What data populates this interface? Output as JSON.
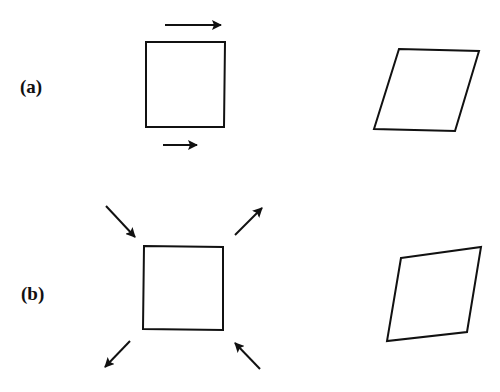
{
  "figure": {
    "panels": [
      {
        "id": "a",
        "label": "(a)",
        "description": "Pure shear: square with horizontal shear arrows deforms into a parallelogram",
        "before": {
          "shape": "square",
          "points": "146,42 225,42 224,127 146,127"
        },
        "after": {
          "shape": "parallelogram",
          "points": "399,49 479,51 455,131 374,129"
        },
        "arrows": [
          {
            "name": "top-shear-arrow",
            "from": [
              165,
              25
            ],
            "to": [
              221,
              25
            ],
            "direction": "right"
          },
          {
            "name": "bottom-shear-arrow",
            "from": [
              163,
              145
            ],
            "to": [
              197,
              145
            ],
            "direction": "right"
          }
        ]
      },
      {
        "id": "b",
        "label": "(b)",
        "description": "Diagonal tension/compression: square deforms into a rhombus",
        "before": {
          "shape": "square",
          "points": "144,246 223,247 223,330 143,329"
        },
        "after": {
          "shape": "rhombus",
          "points": "401,258 481,247 467,332 387,341"
        },
        "arrows": [
          {
            "name": "top-left-compression-arrow",
            "from": [
              106,
              206
            ],
            "to": [
              135,
              237
            ],
            "direction": "inward"
          },
          {
            "name": "top-right-tension-arrow",
            "from": [
              235,
              235
            ],
            "to": [
              262,
              208
            ],
            "direction": "outward"
          },
          {
            "name": "bottom-left-tension-arrow",
            "from": [
              130,
              341
            ],
            "to": [
              105,
              367
            ],
            "direction": "outward"
          },
          {
            "name": "bottom-right-compression-arrow",
            "from": [
              260,
              369
            ],
            "to": [
              235,
              343
            ],
            "direction": "inward"
          }
        ]
      }
    ],
    "colors": {
      "stroke": "#111111",
      "background": "#ffffff"
    }
  }
}
